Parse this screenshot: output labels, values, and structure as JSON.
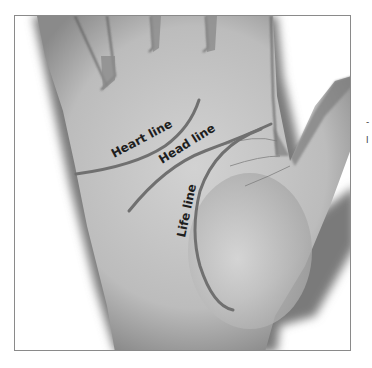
{
  "figure": {
    "labels": {
      "heart_line": "Heart line",
      "head_line": "Head line",
      "life_line": "Life line"
    },
    "edge_fragments": {
      "top": "-",
      "bottom": "l"
    },
    "colors": {
      "palm_line": "#707070",
      "label_text": "#1e1e1e",
      "skin": "#c8c8c8",
      "shadow": "#6a6a6a",
      "frame_border": "#8a8a8a"
    }
  }
}
